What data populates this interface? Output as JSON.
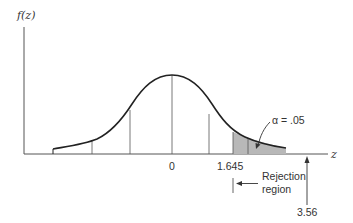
{
  "figure": {
    "type": "normal-distribution-rejection-region",
    "y_axis_label": "f(z)",
    "x_axis_label": "z",
    "tick_labels": {
      "center": "0",
      "critical_value": "1.645"
    },
    "annotations": {
      "alpha": "α = .05",
      "rejection_line1": "Rejection",
      "rejection_line2": "region",
      "test_statistic": "3.56"
    },
    "colors": {
      "curve": "#222222",
      "axes": "#555555",
      "shading": "#b8b8b8",
      "text": "#333333"
    }
  }
}
